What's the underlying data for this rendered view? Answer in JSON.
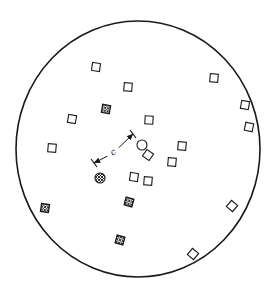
{
  "diagram": {
    "boundary": {
      "shape": "circle",
      "cx": 138,
      "cy": 149,
      "rx": 122,
      "ry": 128,
      "stroke": "#1a1a1a"
    },
    "open_squares": [
      {
        "x": 96,
        "y": 67,
        "rot": 8
      },
      {
        "x": 128,
        "y": 87,
        "rot": 5
      },
      {
        "x": 72,
        "y": 119,
        "rot": 10
      },
      {
        "x": 149,
        "y": 120,
        "rot": 3
      },
      {
        "x": 52,
        "y": 148,
        "rot": 5
      },
      {
        "x": 182,
        "y": 146,
        "rot": 5
      },
      {
        "x": 148,
        "y": 155,
        "rot": 35
      },
      {
        "x": 172,
        "y": 162,
        "rot": 5
      },
      {
        "x": 134,
        "y": 177,
        "rot": 8
      },
      {
        "x": 148,
        "y": 181,
        "rot": 5
      },
      {
        "x": 214,
        "y": 78,
        "rot": 5
      },
      {
        "x": 245,
        "y": 105,
        "rot": 10
      },
      {
        "x": 249,
        "y": 127,
        "rot": 12
      },
      {
        "x": 232,
        "y": 206,
        "rot": 40
      },
      {
        "x": 193,
        "y": 254,
        "rot": 40
      }
    ],
    "hatched_squares": [
      {
        "x": 106,
        "y": 109,
        "rot": 10
      },
      {
        "x": 45,
        "y": 208,
        "rot": 8
      },
      {
        "x": 129,
        "y": 202,
        "rot": 15
      },
      {
        "x": 120,
        "y": 240,
        "rot": 15
      }
    ],
    "open_circle": {
      "x": 142,
      "y": 145,
      "r": 5
    },
    "hatched_circle": {
      "x": 100,
      "y": 178,
      "r": 5
    },
    "dimension": {
      "start": {
        "x": 133,
        "y": 134
      },
      "end": {
        "x": 94,
        "y": 163
      },
      "label": "c",
      "label_pos": {
        "x": 113,
        "y": 152
      }
    },
    "colors": {
      "ink": "#1a1a1a",
      "background": "#ffffff"
    }
  }
}
